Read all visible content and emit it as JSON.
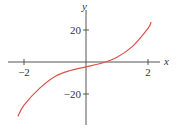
{
  "chart_data": {
    "type": "line",
    "title": "",
    "xlabel": "x",
    "ylabel": "y",
    "xlim": [
      -2.3,
      2.5
    ],
    "ylim": [
      -38,
      38
    ],
    "x_ticks": [
      -2,
      2
    ],
    "x_tick_labels": [
      "−2",
      "2"
    ],
    "y_ticks": [
      -20,
      20
    ],
    "y_tick_labels": [
      "−20",
      "20"
    ],
    "grid": false,
    "legend": null,
    "series": [
      {
        "name": "f(x)",
        "color": "#e0504a",
        "x": [
          -2.2,
          -2.0,
          -1.5,
          -1.0,
          -0.5,
          0.0,
          0.5,
          1.0,
          1.5,
          2.0,
          2.1
        ],
        "y": [
          -34,
          -27,
          -16.5,
          -9,
          -5.3,
          -3,
          -0.8,
          3,
          9.8,
          21,
          25
        ]
      }
    ]
  }
}
